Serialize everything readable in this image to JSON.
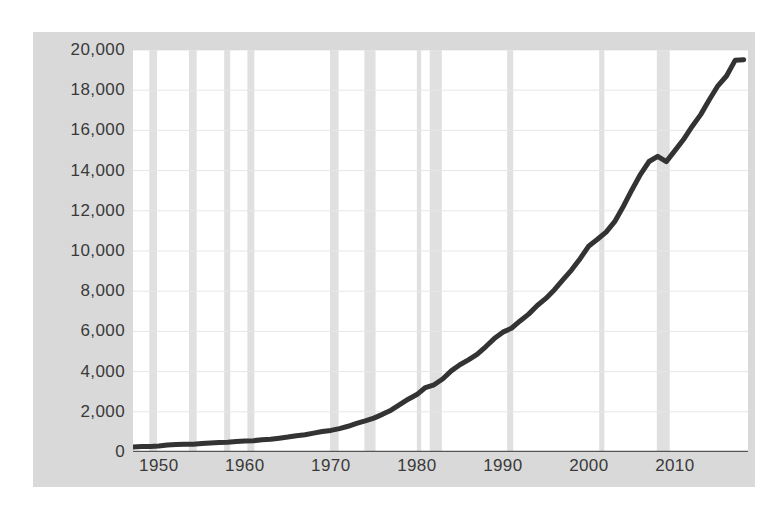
{
  "chart_data": {
    "type": "line",
    "title": "",
    "subtitle": "",
    "xlabel": "",
    "ylabel": "",
    "xlim": [
      1947,
      2018.5
    ],
    "ylim": [
      0,
      20000
    ],
    "grid": "horizontal-and-recession-bands",
    "legend": "none",
    "y_ticks": [
      "0",
      "2,000",
      "4,000",
      "6,000",
      "8,000",
      "10,000",
      "12,000",
      "14,000",
      "16,000",
      "18,000",
      "20,000"
    ],
    "y_tick_values": [
      0,
      2000,
      4000,
      6000,
      8000,
      10000,
      12000,
      14000,
      16000,
      18000,
      20000
    ],
    "x_ticks": [
      "1950",
      "1960",
      "1970",
      "1980",
      "1990",
      "2000",
      "2010"
    ],
    "x_tick_values": [
      1950,
      1960,
      1970,
      1980,
      1990,
      2000,
      2010
    ],
    "series": [
      {
        "name": "series-1",
        "color": "#333333",
        "line_width": 5,
        "x": [
          1947,
          1948,
          1949,
          1950,
          1951,
          1952,
          1953,
          1954,
          1955,
          1956,
          1957,
          1958,
          1959,
          1960,
          1961,
          1962,
          1963,
          1964,
          1965,
          1966,
          1967,
          1968,
          1969,
          1970,
          1971,
          1972,
          1973,
          1974,
          1975,
          1976,
          1977,
          1978,
          1979,
          1980,
          1981,
          1982,
          1983,
          1984,
          1985,
          1986,
          1987,
          1988,
          1989,
          1990,
          1991,
          1992,
          1993,
          1994,
          1995,
          1996,
          1997,
          1998,
          1999,
          2000,
          2001,
          2002,
          2003,
          2004,
          2005,
          2006,
          2007,
          2008,
          2009,
          2010,
          2011,
          2012,
          2013,
          2014,
          2015,
          2016,
          2017,
          2018
        ],
        "y": [
          249,
          274,
          272,
          300,
          347,
          367,
          389,
          391,
          426,
          450,
          474,
          482,
          522,
          543,
          563,
          605,
          638,
          685,
          742,
          813,
          860,
          940,
          1017,
          1073,
          1165,
          1279,
          1425,
          1545,
          1685,
          1873,
          2082,
          2352,
          2627,
          2857,
          3207,
          3344,
          3634,
          4038,
          4339,
          4580,
          4855,
          5236,
          5642,
          5963,
          6158,
          6520,
          6859,
          7287,
          7640,
          8073,
          8578,
          9063,
          9631,
          10252,
          10582,
          10936,
          11458,
          12214,
          13037,
          13815,
          14452,
          14713,
          14449,
          14992,
          15543,
          16197,
          16785,
          17522,
          18219,
          18707,
          19485,
          19519
        ]
      }
    ],
    "recession_bands": [
      {
        "start": 1948.9,
        "end": 1949.8
      },
      {
        "start": 1953.5,
        "end": 1954.4
      },
      {
        "start": 1957.6,
        "end": 1958.3
      },
      {
        "start": 1960.3,
        "end": 1961.1
      },
      {
        "start": 1969.9,
        "end": 1970.9
      },
      {
        "start": 1973.9,
        "end": 1975.2
      },
      {
        "start": 1980.0,
        "end": 1980.5
      },
      {
        "start": 1981.5,
        "end": 1982.9
      },
      {
        "start": 1990.5,
        "end": 1991.2
      },
      {
        "start": 2001.2,
        "end": 2001.8
      },
      {
        "start": 2007.9,
        "end": 2009.4
      }
    ],
    "colors": {
      "line": "#333333",
      "panel_background": "#d9d9d9",
      "plot_background": "#ffffff",
      "gridline": "#e6e6e6",
      "recession_band": "#e0e0e0",
      "tick_label": "#3a3a3a"
    }
  }
}
